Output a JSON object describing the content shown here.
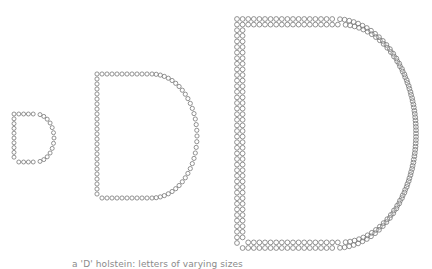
{
  "figure": {
    "stroke_color": "#777777",
    "letters": [
      {
        "label": "D",
        "size": "small",
        "x": 14,
        "y": 114,
        "w": 40,
        "h": 48,
        "r": 2.0,
        "thickness": 1
      },
      {
        "label": "D",
        "size": "medium",
        "x": 97,
        "y": 74,
        "w": 100,
        "h": 124,
        "r": 2.1,
        "thickness": 1
      },
      {
        "label": "D",
        "size": "large",
        "x": 237,
        "y": 19,
        "w": 179,
        "h": 229,
        "r": 2.4,
        "thickness": 2
      }
    ]
  },
  "caption": "a 'D' holstein: letters of varying sizes"
}
